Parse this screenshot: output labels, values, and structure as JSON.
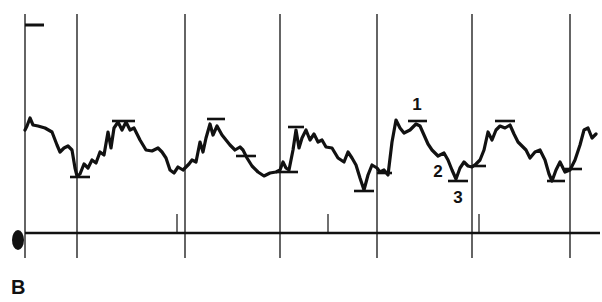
{
  "panel": {
    "label": "B"
  },
  "colors": {
    "ink": "#111111",
    "background": "#ffffff"
  },
  "chart_data": {
    "type": "line",
    "title": "",
    "xlabel": "",
    "ylabel": "",
    "grid": {
      "vertical_markers_x": [
        25,
        77,
        185,
        280,
        377,
        472,
        570
      ],
      "top_y": 14,
      "bottom_y": 258
    },
    "baseline": {
      "y": 233,
      "x_start": 25,
      "x_end": 600,
      "small_ticks_x": [
        177,
        328,
        479
      ]
    },
    "calibration_mark": {
      "x1": 25,
      "x2": 44,
      "y": 25
    },
    "series": [
      {
        "name": "trace",
        "points": [
          [
            25,
            130
          ],
          [
            27,
            126
          ],
          [
            30,
            118
          ],
          [
            33,
            125
          ],
          [
            38,
            126
          ],
          [
            45,
            128
          ],
          [
            52,
            132
          ],
          [
            57,
            145
          ],
          [
            60,
            152
          ],
          [
            64,
            148
          ],
          [
            68,
            146
          ],
          [
            72,
            150
          ],
          [
            75,
            168
          ],
          [
            77,
            176
          ],
          [
            80,
            174
          ],
          [
            84,
            164
          ],
          [
            88,
            168
          ],
          [
            92,
            160
          ],
          [
            96,
            163
          ],
          [
            100,
            152
          ],
          [
            104,
            155
          ],
          [
            108,
            132
          ],
          [
            111,
            148
          ],
          [
            114,
            128
          ],
          [
            118,
            122
          ],
          [
            122,
            130
          ],
          [
            126,
            122
          ],
          [
            130,
            130
          ],
          [
            134,
            128
          ],
          [
            140,
            140
          ],
          [
            146,
            150
          ],
          [
            152,
            151
          ],
          [
            158,
            148
          ],
          [
            162,
            152
          ],
          [
            166,
            158
          ],
          [
            170,
            170
          ],
          [
            174,
            173
          ],
          [
            178,
            167
          ],
          [
            183,
            170
          ],
          [
            185,
            168
          ],
          [
            189,
            164
          ],
          [
            192,
            160
          ],
          [
            196,
            162
          ],
          [
            200,
            142
          ],
          [
            203,
            152
          ],
          [
            206,
            138
          ],
          [
            210,
            124
          ],
          [
            213,
            135
          ],
          [
            217,
            126
          ],
          [
            222,
            135
          ],
          [
            226,
            140
          ],
          [
            230,
            145
          ],
          [
            235,
            150
          ],
          [
            240,
            147
          ],
          [
            243,
            150
          ],
          [
            247,
            158
          ],
          [
            252,
            166
          ],
          [
            258,
            172
          ],
          [
            264,
            176
          ],
          [
            270,
            173
          ],
          [
            276,
            172
          ],
          [
            280,
            170
          ],
          [
            283,
            162
          ],
          [
            286,
            168
          ],
          [
            289,
            170
          ],
          [
            293,
            150
          ],
          [
            296,
            130
          ],
          [
            299,
            148
          ],
          [
            302,
            138
          ],
          [
            306,
            130
          ],
          [
            310,
            140
          ],
          [
            314,
            134
          ],
          [
            318,
            142
          ],
          [
            322,
            140
          ],
          [
            326,
            147
          ],
          [
            332,
            148
          ],
          [
            338,
            158
          ],
          [
            344,
            162
          ],
          [
            348,
            152
          ],
          [
            352,
            158
          ],
          [
            356,
            165
          ],
          [
            360,
            178
          ],
          [
            364,
            190
          ],
          [
            368,
            175
          ],
          [
            372,
            165
          ],
          [
            377,
            168
          ],
          [
            380,
            172
          ],
          [
            384,
            170
          ],
          [
            388,
            175
          ],
          [
            392,
            142
          ],
          [
            396,
            120
          ],
          [
            400,
            128
          ],
          [
            404,
            133
          ],
          [
            410,
            130
          ],
          [
            416,
            124
          ],
          [
            420,
            126
          ],
          [
            424,
            135
          ],
          [
            428,
            144
          ],
          [
            432,
            150
          ],
          [
            438,
            156
          ],
          [
            444,
            153
          ],
          [
            448,
            160
          ],
          [
            452,
            170
          ],
          [
            456,
            179
          ],
          [
            460,
            168
          ],
          [
            464,
            162
          ],
          [
            468,
            166
          ],
          [
            472,
            167
          ],
          [
            476,
            164
          ],
          [
            480,
            160
          ],
          [
            484,
            150
          ],
          [
            488,
            132
          ],
          [
            492,
            140
          ],
          [
            496,
            130
          ],
          [
            500,
            126
          ],
          [
            505,
            128
          ],
          [
            510,
            125
          ],
          [
            514,
            134
          ],
          [
            518,
            142
          ],
          [
            522,
            146
          ],
          [
            526,
            150
          ],
          [
            530,
            158
          ],
          [
            535,
            152
          ],
          [
            540,
            150
          ],
          [
            545,
            160
          ],
          [
            549,
            174
          ],
          [
            552,
            181
          ],
          [
            556,
            170
          ],
          [
            560,
            162
          ],
          [
            565,
            172
          ],
          [
            570,
            170
          ],
          [
            575,
            160
          ],
          [
            580,
            145
          ],
          [
            584,
            130
          ],
          [
            588,
            128
          ],
          [
            592,
            138
          ],
          [
            596,
            134
          ]
        ]
      }
    ],
    "level_markers": [
      {
        "x1": 70,
        "x2": 90,
        "y": 177
      },
      {
        "x1": 112,
        "x2": 135,
        "y": 121
      },
      {
        "x1": 207,
        "x2": 225,
        "y": 119
      },
      {
        "x1": 236,
        "x2": 256,
        "y": 156
      },
      {
        "x1": 276,
        "x2": 298,
        "y": 172
      },
      {
        "x1": 288,
        "x2": 304,
        "y": 127
      },
      {
        "x1": 354,
        "x2": 374,
        "y": 191
      },
      {
        "x1": 377,
        "x2": 392,
        "y": 173
      },
      {
        "x1": 408,
        "x2": 427,
        "y": 121
      },
      {
        "x1": 448,
        "x2": 468,
        "y": 181
      },
      {
        "x1": 472,
        "x2": 486,
        "y": 166
      },
      {
        "x1": 495,
        "x2": 515,
        "y": 121
      },
      {
        "x1": 547,
        "x2": 565,
        "y": 181
      },
      {
        "x1": 565,
        "x2": 582,
        "y": 169
      }
    ],
    "annotations": [
      {
        "text": "1",
        "x": 417,
        "y": 110
      },
      {
        "text": "2",
        "x": 438,
        "y": 177
      },
      {
        "text": "3",
        "x": 458,
        "y": 203
      }
    ],
    "origin_marker": {
      "cx": 18,
      "cy": 240,
      "rx": 6,
      "ry": 10
    }
  }
}
